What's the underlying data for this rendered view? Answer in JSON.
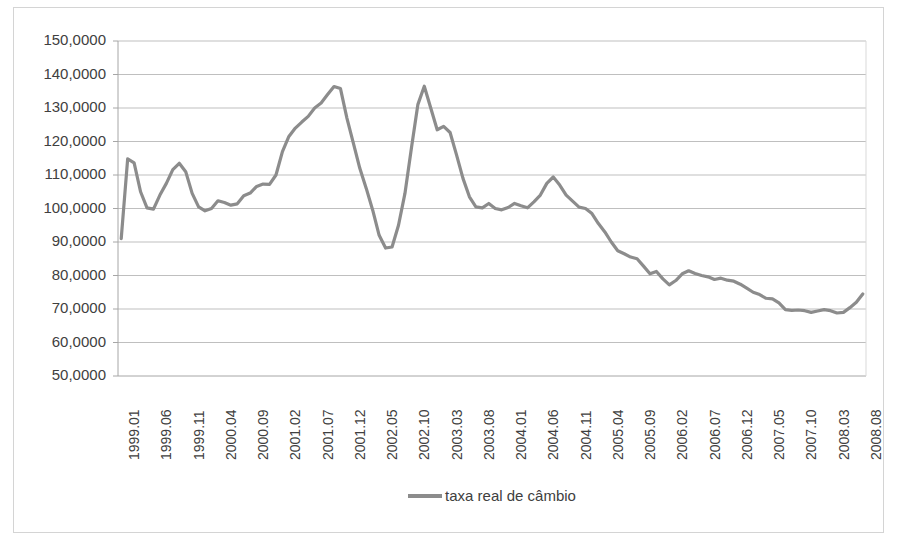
{
  "chart_data": {
    "type": "line",
    "title": "",
    "xlabel": "",
    "ylabel": "",
    "ylim": [
      50,
      150
    ],
    "ytick_step": 10,
    "grid": true,
    "legend_position": "bottom",
    "y_tick_labels": [
      "150,0000",
      "140,0000",
      "130,0000",
      "120,0000",
      "110,0000",
      "100,0000",
      "90,0000",
      "80,0000",
      "70,0000",
      "60,0000",
      "50,0000"
    ],
    "x_tick_labels": [
      "1999.01",
      "1999.06",
      "1999.11",
      "2000.04",
      "2000.09",
      "2001.02",
      "2001.07",
      "2001.12",
      "2002.05",
      "2002.10",
      "2003.03",
      "2003.08",
      "2004.01",
      "2004.06",
      "2004.11",
      "2005.04",
      "2005.09",
      "2006.02",
      "2006.07",
      "2006.12",
      "2007.05",
      "2007.10",
      "2008.03",
      "2008.08"
    ],
    "x_tick_interval_months": 5,
    "series": [
      {
        "name": "taxa real de câmbio",
        "color": "#8c8c8c",
        "x": [
          "1999.01",
          "1999.02",
          "1999.03",
          "1999.04",
          "1999.05",
          "1999.06",
          "1999.07",
          "1999.08",
          "1999.09",
          "1999.10",
          "1999.11",
          "1999.12",
          "2000.01",
          "2000.02",
          "2000.03",
          "2000.04",
          "2000.05",
          "2000.06",
          "2000.07",
          "2000.08",
          "2000.09",
          "2000.10",
          "2000.11",
          "2000.12",
          "2001.01",
          "2001.02",
          "2001.03",
          "2001.04",
          "2001.05",
          "2001.06",
          "2001.07",
          "2001.08",
          "2001.09",
          "2001.10",
          "2001.11",
          "2001.12",
          "2002.01",
          "2002.02",
          "2002.03",
          "2002.04",
          "2002.05",
          "2002.06",
          "2002.07",
          "2002.08",
          "2002.09",
          "2002.10",
          "2002.11",
          "2002.12",
          "2003.01",
          "2003.02",
          "2003.03",
          "2003.04",
          "2003.05",
          "2003.06",
          "2003.07",
          "2003.08",
          "2003.09",
          "2003.10",
          "2003.11",
          "2003.12",
          "2004.01",
          "2004.02",
          "2004.03",
          "2004.04",
          "2004.05",
          "2004.06",
          "2004.07",
          "2004.08",
          "2004.09",
          "2004.10",
          "2004.11",
          "2004.12",
          "2005.01",
          "2005.02",
          "2005.03",
          "2005.04",
          "2005.05",
          "2005.06",
          "2005.07",
          "2005.08",
          "2005.09",
          "2005.10",
          "2005.11",
          "2005.12",
          "2006.01",
          "2006.02",
          "2006.03",
          "2006.04",
          "2006.05",
          "2006.06",
          "2006.07",
          "2006.08",
          "2006.09",
          "2006.10",
          "2006.11",
          "2006.12",
          "2007.01",
          "2007.02",
          "2007.03",
          "2007.04",
          "2007.05",
          "2007.06",
          "2007.07",
          "2007.08",
          "2007.09",
          "2007.10",
          "2007.11",
          "2007.12",
          "2008.01",
          "2008.02",
          "2008.03",
          "2008.04",
          "2008.05",
          "2008.06",
          "2008.07",
          "2008.08"
        ],
        "values": [
          91.0,
          114.8,
          113.6,
          105.0,
          100.2,
          99.8,
          104.0,
          107.5,
          111.6,
          113.5,
          111.0,
          104.5,
          100.5,
          99.3,
          100.0,
          102.3,
          101.8,
          101.0,
          101.4,
          103.8,
          104.6,
          106.6,
          107.3,
          107.2,
          110.0,
          117.0,
          121.5,
          124.0,
          125.8,
          127.5,
          130.0,
          131.5,
          134.0,
          136.4,
          135.8,
          127.0,
          119.5,
          112.0,
          106.0,
          99.5,
          92.0,
          88.2,
          88.5,
          95.0,
          104.5,
          118.0,
          131.0,
          136.5,
          130.0,
          123.5,
          124.5,
          122.7,
          116.0,
          109.0,
          103.5,
          100.5,
          100.2,
          101.5,
          100.0,
          99.6,
          100.3,
          101.5,
          100.8,
          100.2,
          102.0,
          104.0,
          107.5,
          109.4,
          107.0,
          104.0,
          102.2,
          100.4,
          100.0,
          98.5,
          95.5,
          93.0,
          90.0,
          87.4,
          86.5,
          85.5,
          85.0,
          82.8,
          80.5,
          81.2,
          79.0,
          77.2,
          78.5,
          80.5,
          81.4,
          80.6,
          80.0,
          79.6,
          78.8,
          79.2,
          78.6,
          78.3,
          77.4,
          76.2,
          75.0,
          74.3,
          73.2,
          73.0,
          71.8,
          69.8,
          69.6,
          69.7,
          69.5,
          69.0,
          69.4,
          69.8,
          69.5,
          68.8,
          69.0,
          70.4,
          72.0,
          74.5
        ]
      }
    ]
  },
  "legend": {
    "entry_label": "taxa real de câmbio",
    "swatch_name": "line-swatch"
  }
}
